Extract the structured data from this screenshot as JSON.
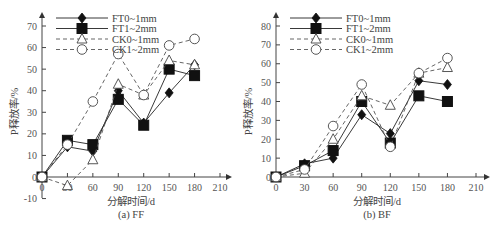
{
  "chart_data": [
    {
      "type": "line",
      "title": "(a) FF",
      "xlabel": "分解时间/d",
      "ylabel": "P释放率/%",
      "x": [
        0,
        30,
        60,
        90,
        120,
        150,
        180
      ],
      "xticks": [
        0,
        30,
        60,
        90,
        120,
        150,
        180,
        210
      ],
      "yticks": [
        -10,
        0,
        10,
        20,
        30,
        40,
        50,
        60,
        70
      ],
      "xlim": [
        0,
        210
      ],
      "ylim": [
        -10,
        70
      ],
      "grid": false,
      "legend_position": "upper-left",
      "series": [
        {
          "name": "FT0~1mm",
          "marker": "diamond-filled",
          "line": "solid",
          "values": [
            0,
            14,
            12,
            40,
            25,
            39,
            52
          ]
        },
        {
          "name": "FT1~2mm",
          "marker": "square-filled",
          "line": "solid",
          "values": [
            0,
            17,
            15,
            36,
            24,
            50,
            47
          ]
        },
        {
          "name": "CK0~1mm",
          "marker": "triangle-open",
          "line": "dashed",
          "values": [
            0,
            -4,
            8,
            43,
            38,
            54,
            52
          ]
        },
        {
          "name": "CK1~2mm",
          "marker": "circle-open",
          "line": "dashed",
          "values": [
            0,
            15,
            35,
            57,
            38,
            61,
            64
          ]
        }
      ]
    },
    {
      "type": "line",
      "title": "(b) BF",
      "xlabel": "分解时间/d",
      "ylabel": "P释放率/%",
      "x": [
        0,
        30,
        60,
        90,
        120,
        150,
        180
      ],
      "xticks": [
        0,
        30,
        60,
        90,
        120,
        150,
        180,
        210
      ],
      "yticks": [
        0,
        10,
        20,
        30,
        40,
        50,
        60,
        70,
        80
      ],
      "xlim": [
        0,
        210
      ],
      "ylim": [
        0,
        80
      ],
      "grid": false,
      "legend_position": "upper-left",
      "series": [
        {
          "name": "FT0~1mm",
          "marker": "diamond-filled",
          "line": "solid",
          "values": [
            0,
            7,
            10,
            33,
            23,
            51,
            49
          ]
        },
        {
          "name": "FT1~2mm",
          "marker": "square-filled",
          "line": "solid",
          "values": [
            0,
            6,
            14,
            40,
            18,
            43,
            40
          ]
        },
        {
          "name": "CK0~1mm",
          "marker": "triangle-open",
          "line": "dashed",
          "values": [
            0,
            2,
            20,
            43,
            38,
            55,
            58
          ]
        },
        {
          "name": "CK1~2mm",
          "marker": "circle-open",
          "line": "dashed",
          "values": [
            0,
            4,
            27,
            49,
            16,
            55,
            63
          ]
        }
      ]
    }
  ],
  "panels": [
    {
      "caption": "(a) FF",
      "xlabel": "分解时间/d",
      "ylabel": "P释放率/%"
    },
    {
      "caption": "(b) BF",
      "xlabel": "分解时间/d",
      "ylabel": "P释放率/%"
    }
  ]
}
